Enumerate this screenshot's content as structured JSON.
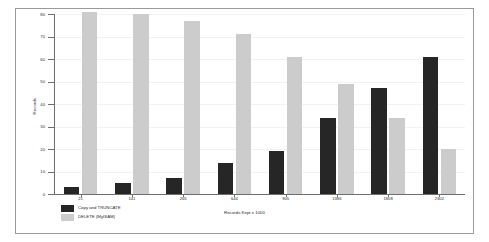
{
  "chart_data": {
    "type": "bar",
    "title": "",
    "xlabel": "Records Kept x 1000",
    "ylabel": "Records",
    "categories": [
      "21",
      "141",
      "265",
      "644",
      "905",
      "1386",
      "1808",
      "2302"
    ],
    "series": [
      {
        "name": "Copy and TRUNCATE",
        "color": "#262626",
        "values": [
          3,
          5,
          7,
          14,
          19,
          34,
          47,
          61
        ]
      },
      {
        "name": "DELETE (MyISAM)",
        "color": "#cccccc",
        "values": [
          81,
          80,
          77,
          71,
          61,
          49,
          34,
          20
        ]
      }
    ],
    "ylim": [
      0,
      80
    ],
    "yticks": [
      "0",
      "10",
      "20",
      "30",
      "40",
      "50",
      "60",
      "70",
      "80"
    ],
    "grid": true,
    "legend_position": "bottom-left"
  }
}
